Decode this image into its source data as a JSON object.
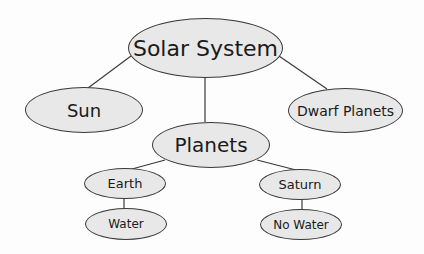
{
  "diagram": {
    "type": "concept-map",
    "colors": {
      "node_fill": "#e8e8e8",
      "node_stroke": "#3a3a3a",
      "line": "#3a3a3a",
      "background": "#fdfdfd"
    },
    "nodes": {
      "root": "Solar System",
      "sun": "Sun",
      "dwarf": "Dwarf Planets",
      "planets": "Planets",
      "earth": "Earth",
      "water": "Water",
      "saturn": "Saturn",
      "nowater": "No Water"
    },
    "edges": [
      [
        "Solar System",
        "Sun"
      ],
      [
        "Solar System",
        "Planets"
      ],
      [
        "Solar System",
        "Dwarf Planets"
      ],
      [
        "Planets",
        "Earth"
      ],
      [
        "Planets",
        "Saturn"
      ],
      [
        "Earth",
        "Water"
      ],
      [
        "Saturn",
        "No Water"
      ]
    ]
  }
}
